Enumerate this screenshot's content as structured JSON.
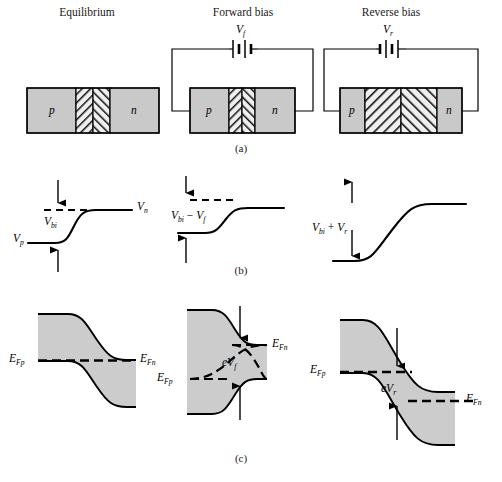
{
  "figure": {
    "columns": [
      {
        "title": "Equilibrium"
      },
      {
        "title": "Forward bias"
      },
      {
        "title": "Reverse bias"
      }
    ],
    "captions": {
      "a": "(a)",
      "b": "(b)",
      "c": "(c)"
    },
    "colors": {
      "neutral_region_fill": "#c9c9c9",
      "depletion_fill": "#e8e8e8",
      "band_fill": "#cccccc",
      "line": "#000000",
      "text": "#1a1a1a"
    },
    "row_a": {
      "name": "pn-junction-block-diagrams",
      "blocks": [
        {
          "condition": "Equilibrium",
          "p_label": "p",
          "n_label": "n",
          "has_circuit": false,
          "depletion_width_rel": "narrow"
        },
        {
          "condition": "Forward bias",
          "p_label": "p",
          "n_label": "n",
          "has_circuit": true,
          "source_label": "V",
          "source_sub": "f",
          "depletion_width_rel": "narrowest"
        },
        {
          "condition": "Reverse bias",
          "p_label": "p",
          "n_label": "n",
          "has_circuit": true,
          "source_label": "V",
          "source_sub": "r",
          "depletion_width_rel": "widest"
        }
      ]
    },
    "row_b": {
      "name": "electrostatic-potential-plots",
      "plots": [
        {
          "condition": "Equilibrium",
          "barrier_label_main": "V",
          "barrier_label_sub": "bi",
          "left_label_main": "V",
          "left_label_sub": "p",
          "right_label_main": "V",
          "right_label_sub": "n",
          "barrier_rel_height": "medium"
        },
        {
          "condition": "Forward bias",
          "barrier_label_main": "V",
          "barrier_label_sub": "bi",
          "barrier_label_op": " − ",
          "barrier_label_main2": "V",
          "barrier_label_sub2": "f",
          "barrier_rel_height": "small"
        },
        {
          "condition": "Reverse bias",
          "barrier_label_main": "V",
          "barrier_label_sub": "bi",
          "barrier_label_op": " + ",
          "barrier_label_main2": "V",
          "barrier_label_sub2": "r",
          "barrier_rel_height": "large"
        }
      ]
    },
    "row_c": {
      "name": "energy-band-diagrams",
      "diagrams": [
        {
          "condition": "Equilibrium",
          "efp_main": "E",
          "efp_sub": "Fp",
          "efn_main": "E",
          "efn_sub": "Fn",
          "split": "none",
          "split_label": ""
        },
        {
          "condition": "Forward bias",
          "efp_main": "E",
          "efp_sub": "Fp",
          "efn_main": "E",
          "efn_sub": "Fn",
          "split": "efn-above-efp",
          "split_label_e": "e",
          "split_label_main": "V",
          "split_label_sub": "f"
        },
        {
          "condition": "Reverse bias",
          "efp_main": "E",
          "efp_sub": "Fp",
          "efn_main": "E",
          "efn_sub": "Fn",
          "split": "efn-below-efp",
          "split_label_e": "e",
          "split_label_main": "V",
          "split_label_sub": "r"
        }
      ]
    }
  }
}
